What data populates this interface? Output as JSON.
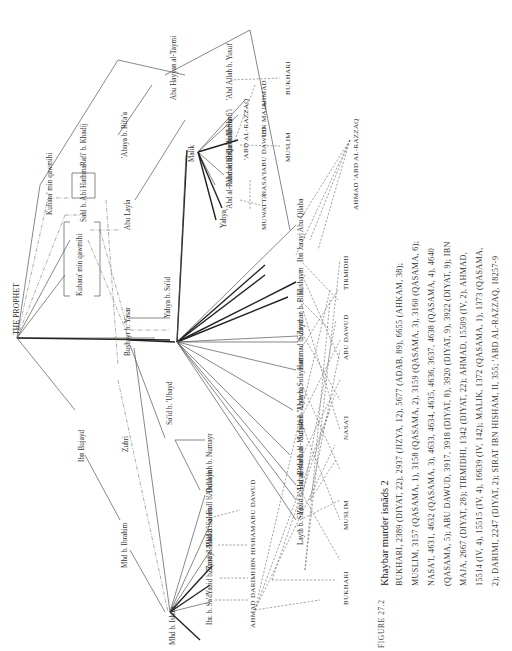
{
  "page": {
    "orientation": "rotated 90 degrees counter-clockwise",
    "page_number": "887"
  },
  "figure": {
    "label": "FIGURE 27.2",
    "title": "Khaybar murder isnāds 2",
    "caption_lines": [
      "BUKHARI, 2389 (DIYAT, 22), 2937 (JIZYA, 12), 5677 (ADAB, 89), 6655 (AHKAM, 38);",
      "MUSLIM, 3157 (QASAMA, 1), 3158 (QASAMA, 2), 3159 (QASAMA, 3), 3160 (QASAMA, 6);",
      "NASA'I, 4631, 4632 (QASAMA, 3), 4633, 4634, 4635, 4636, 3637, 4638 (QASAMA, 4), 4640",
      "(QASAMA, 5); ABU DAWUD, 3917, 3918 (DIYAT, 8), 3920 (DIYAT, 9), 3922 (DIYAT, 9); IBN",
      "MAJA, 2667 (DIYAT, 28); TIRMIDHI, 1342 (DIYAT, 22); AHMAD, 15509 (IV, 2), AHMAD,",
      "15514 (IV, 4), 15515 (IV, 4), 16639 (IV, 142); MALIK, 1372 (QASAMA, 1), 1373 (QASAMA,",
      "2); DARIMI, 2247 (DIYAT, 2); SIRAT IBN HISHAM, II, 355; 'ABD AL-RAZZAQ, 18257-9"
    ]
  },
  "diagram": {
    "root": "THE PROPHET",
    "companions": [
      "Kubara' min qawmihi",
      "Kubara' min qawmihi",
      "Sahl b. Abi Hathma",
      "Rafi' b. Khadij",
      "'Abaya b. Rifa'a",
      "Abu Layla",
      "Bushayr b. Yasar",
      "Sa'id b. 'Ubayd",
      "Abu Hayyan al-Taymi"
    ],
    "successors": [
      "Ibn Bujayd",
      "Zuhri",
      "Mhd b. Ibrahim",
      "Mhd b. Ishaq",
      "Yahya b. Sa'id",
      "Malik"
    ],
    "transmitters_ishaq": [
      "Ibr. b. Sa'd",
      "Yazid b. Zuray'",
      "Ziyad al-Bakka'i",
      "Mhd b. Salam",
      "al-Fadl b. Dukayn",
      "'Abd Allah b. Numayr"
    ],
    "transmitters_yahya": [
      "Layth b. Sa'd",
      "Yazid b. Harun",
      "'Abd al-Wahhab",
      "Bishr b. al-Mufaddal",
      "Sufyan b. 'Uyayna",
      "'Abda b. Sulayman",
      "Hammad b. Zayd",
      "Sulayman b. Bilal",
      "Hushaym",
      "Ibn Jurayj",
      "Abu Qilaba"
    ],
    "transmitters_malik": [
      "Yahya",
      "'Abd al-Rahman b. Qasim",
      "'Abd Allah b. Wahb",
      "Bishr b. 'Umar",
      "al-Shafi'i",
      "'Abd Allah b. Yusuf"
    ],
    "collections_bottom": [
      "AHMAD",
      "DARIMI",
      "IBN HISHAM",
      "ABU DAWUD",
      "BUKHARI",
      "MUSLIM",
      "NASA'I",
      "ABU DAWUD",
      "TIRMIDHI",
      "AHMAD 'ABD AL-RAZZAQ"
    ],
    "collections_malik": [
      "MUWATTA'",
      "NASA'I",
      "ABU DAWUD",
      "IBN MAJA",
      "AHMAD",
      "'ABD AL-RAZZAQ",
      "MUSLIM",
      "BUKHARI"
    ]
  }
}
